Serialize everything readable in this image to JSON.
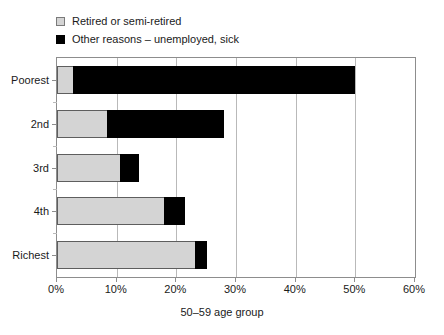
{
  "chart_data": {
    "type": "bar",
    "orientation": "horizontal",
    "stacked": true,
    "title": "",
    "xlabel": "50–59 age group",
    "ylabel": "",
    "xlim": [
      0,
      60
    ],
    "xunit": "%",
    "xticks": [
      0,
      10,
      20,
      30,
      40,
      50,
      60
    ],
    "xtick_labels": [
      "0%",
      "10%",
      "20%",
      "30%",
      "40%",
      "50%",
      "60%"
    ],
    "categories": [
      "Poorest",
      "2nd",
      "3rd",
      "4th",
      "Richest"
    ],
    "grid": "vertical",
    "legend_position": "above-plot-left",
    "series": [
      {
        "name": "Retired or semi-retired",
        "color": "#d4d4d4",
        "values": [
          2.6,
          8.3,
          10.5,
          18.0,
          23.1
        ]
      },
      {
        "name": "Other reasons – unemployed, sick",
        "color": "#000000",
        "values": [
          47.4,
          19.7,
          3.3,
          3.5,
          2.1
        ]
      }
    ],
    "totals": [
      50.0,
      28.0,
      13.8,
      21.5,
      25.2
    ]
  },
  "legend": {
    "items": [
      {
        "label": "Retired or semi-retired",
        "swatch": "light-gray-square"
      },
      {
        "label": "Other reasons – unemployed, sick",
        "swatch": "black-square"
      }
    ]
  },
  "axes": {
    "x": {
      "title": "50–59 age group",
      "tick_labels": [
        "0%",
        "10%",
        "20%",
        "30%",
        "40%",
        "50%",
        "60%"
      ]
    },
    "y": {
      "tick_labels": [
        "Poorest",
        "2nd",
        "3rd",
        "4th",
        "Richest"
      ]
    }
  },
  "colors": {
    "retired": "#d4d4d4",
    "other": "#000000",
    "frame": "#8d8d8d",
    "grid": "#b9b9b9",
    "text": "#1a1a1a",
    "background": "#ffffff"
  }
}
